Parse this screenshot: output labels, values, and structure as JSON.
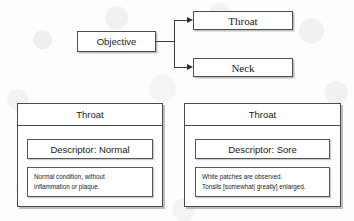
{
  "diagram": {
    "flow": {
      "root": {
        "label": "Objective"
      },
      "children": [
        {
          "label": "Throat"
        },
        {
          "label": "Neck"
        }
      ],
      "arrow_icon": "arrow-right-icon"
    },
    "panels": [
      {
        "id": "throat-normal",
        "header": "Throat",
        "descriptor": "Descriptor: Normal",
        "detail_lines": [
          "Normal condition, without",
          "inflammation or plaque."
        ]
      },
      {
        "id": "throat-sore",
        "header": "Throat",
        "descriptor": "Descriptor: Sore",
        "detail_lines": [
          "White patches are observed.",
          "Tonsils [somewhat| greatly] enlarged."
        ]
      }
    ]
  },
  "colors": {
    "page_background": "#fdfdfc",
    "box_border": "#4d4d4d",
    "box_fill": "#ffffff",
    "text": "#1a1a1a",
    "connector": "#3a3a3a",
    "shadow": "#7d7d7d"
  }
}
